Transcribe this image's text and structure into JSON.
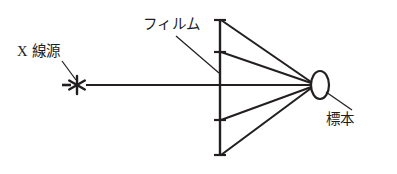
{
  "figure": {
    "type": "schematic-diagram",
    "background_color": "#ffffff",
    "line_color": "#231f20",
    "width": 397,
    "height": 174
  },
  "labels": {
    "source": "X 線源",
    "film": "フィルム",
    "specimen": "標本"
  },
  "elements": {
    "source_marker": "asterisk-star-icon",
    "film_marker": "vertical-line",
    "specimen_marker": "ellipse"
  },
  "geometry": {
    "source_point": {
      "x": 77,
      "y": 85
    },
    "specimen_point": {
      "x": 315,
      "y": 85
    },
    "film_plane_x": 220,
    "film_top": {
      "x": 220,
      "y": 20
    },
    "film_bottom": {
      "x": 220,
      "y": 155
    },
    "ray_endpoints_on_film": [
      20,
      52,
      85,
      120,
      155
    ],
    "leader_source": {
      "x1": 63,
      "y1": 62,
      "x2": 75,
      "y2": 80
    },
    "leader_film": {
      "x1": 176,
      "y1": 36,
      "x2": 219,
      "y2": 73
    },
    "leader_specimen": {
      "x1": 324,
      "y1": 90,
      "x2": 352,
      "y2": 110
    }
  }
}
